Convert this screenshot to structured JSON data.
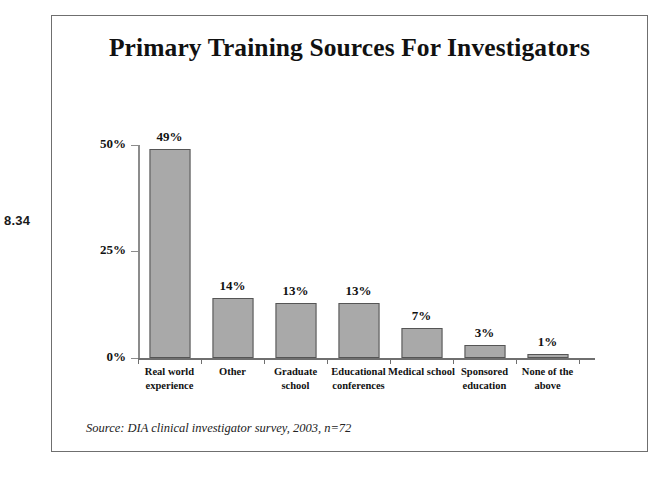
{
  "figure_number": "8.34",
  "chart_data": {
    "type": "bar",
    "title": "Primary Training Sources For Investigators",
    "xlabel": "",
    "ylabel": "",
    "ylim": [
      0,
      50
    ],
    "grid": false,
    "legend": "none",
    "y_ticks": [
      "0%",
      "25%",
      "50%"
    ],
    "y_tick_values": [
      0,
      25,
      50
    ],
    "categories": [
      "Real world experience",
      "Other",
      "Graduate school",
      "Educational conferences",
      "Medical school",
      "Sponsored education",
      "None of the above"
    ],
    "values": [
      49,
      14,
      13,
      13,
      7,
      3,
      1
    ],
    "data_labels": [
      "49%",
      "14%",
      "13%",
      "13%",
      "7%",
      "3%",
      "1%"
    ],
    "bar_color": "#a9a9a9",
    "bar_border_color": "#555555",
    "annotation": "Source: DIA clinical investigator survey, 2003, n=72"
  }
}
